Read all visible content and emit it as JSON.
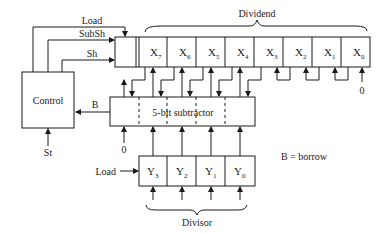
{
  "diagram": {
    "control": {
      "label": "Control",
      "input": "St",
      "output_label": "B"
    },
    "signals": {
      "load_top": "Load",
      "subsh": "SubSh",
      "sh": "Sh",
      "load_divisor": "Load"
    },
    "dividend": {
      "label": "Dividend",
      "cells": [
        {
          "base": "X",
          "sub": "7"
        },
        {
          "base": "X",
          "sub": "6"
        },
        {
          "base": "X",
          "sub": "5"
        },
        {
          "base": "X",
          "sub": "4"
        },
        {
          "base": "X",
          "sub": "3"
        },
        {
          "base": "X",
          "sub": "2"
        },
        {
          "base": "X",
          "sub": "1"
        },
        {
          "base": "X",
          "sub": "0"
        }
      ],
      "x0_input": "0"
    },
    "subtractor": {
      "label": "5-bit subtractor",
      "extra_input": "0"
    },
    "divisor": {
      "label": "Divisor",
      "cells": [
        {
          "base": "Y",
          "sub": "3"
        },
        {
          "base": "Y",
          "sub": "2"
        },
        {
          "base": "Y",
          "sub": "1"
        },
        {
          "base": "Y",
          "sub": "0"
        }
      ]
    },
    "legend": "B = borrow"
  }
}
